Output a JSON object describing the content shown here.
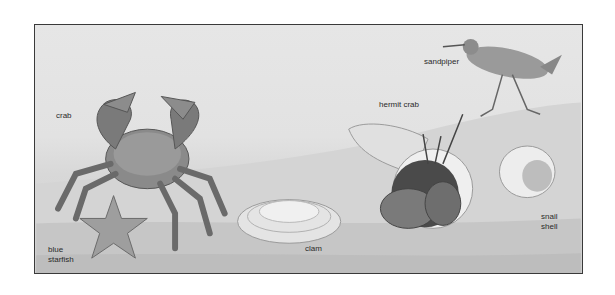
{
  "illustration": {
    "title": "Beach creatures illustration",
    "style": "grayscale",
    "labels": {
      "crab": "crab",
      "sandpiper": "sandpiper",
      "hermit_crab": "hermit crab",
      "clam": "clam",
      "snail_shell_line1": "snail",
      "snail_shell_line2": "shell",
      "blue_starfish_line1": "blue",
      "blue_starfish_line2": "starfish"
    }
  }
}
